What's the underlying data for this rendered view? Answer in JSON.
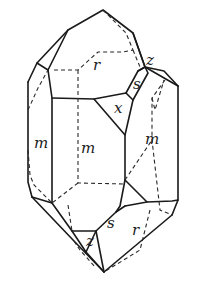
{
  "figure": {
    "face_labels": {
      "r_top": "r",
      "z_top": "z",
      "s_top": "s",
      "x": "x",
      "m_left": "m",
      "m_center": "m",
      "m_right": "m",
      "s_bottom": "s",
      "z_bottom": "z",
      "r_bottom": "r"
    }
  }
}
